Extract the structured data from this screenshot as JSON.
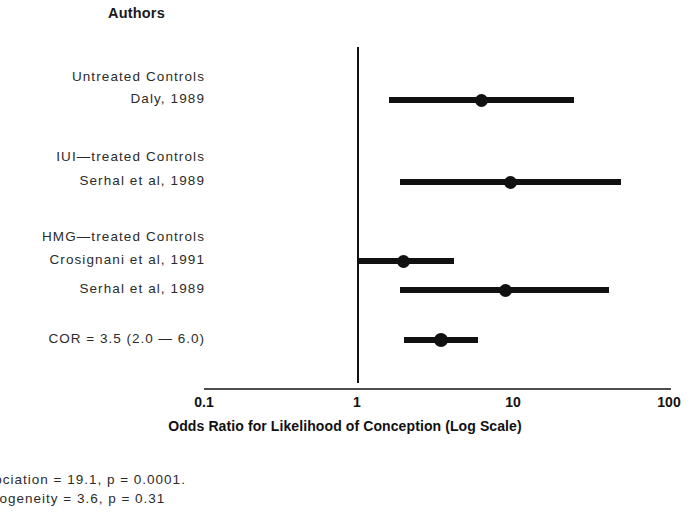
{
  "figure": {
    "heading": "Authors",
    "axis_title": "Odds Ratio for Likelihood of Conception (Log Scale)"
  },
  "rows": [
    {
      "label": "Untreated Controls",
      "kind": "group"
    },
    {
      "label": "Daly, 1989",
      "kind": "study"
    },
    {
      "label": "IUI—treated Controls",
      "kind": "group"
    },
    {
      "label": "Serhal et al, 1989",
      "kind": "study"
    },
    {
      "label": "HMG—treated Controls",
      "kind": "group"
    },
    {
      "label": "Crosignani et al, 1991",
      "kind": "study"
    },
    {
      "label": "Serhal et al, 1989",
      "kind": "study"
    },
    {
      "label": "COR = 3.5 (2.0 — 6.0)",
      "kind": "summary"
    }
  ],
  "footnote": {
    "line1": "r association = 19.1, p = 0.0001.",
    "line2": "r homogeneity = 3.6, p = 0.31"
  },
  "chart_data": {
    "type": "forest",
    "title": "",
    "xlabel": "Odds Ratio for Likelihood of Conception (Log Scale)",
    "ylabel": "Authors",
    "scale": "log10",
    "xlim": [
      0.1,
      100
    ],
    "xticks": [
      "0.1",
      "1",
      "10",
      "100"
    ],
    "xtick_values": [
      0.1,
      1,
      10,
      100
    ],
    "reference_line": 1,
    "grid": false,
    "legend": null,
    "groups": [
      {
        "name": "Untreated Controls"
      },
      {
        "name": "IUI—treated Controls"
      },
      {
        "name": "HMG—treated Controls"
      }
    ],
    "points": [
      {
        "label": "Daly, 1989",
        "group": "Untreated Controls",
        "or": 6.3,
        "ci_low": 1.6,
        "ci_high": 25.0,
        "summary": false
      },
      {
        "label": "Serhal et al, 1989",
        "group": "IUI—treated Controls",
        "or": 9.8,
        "ci_low": 1.9,
        "ci_high": 50.0,
        "summary": false
      },
      {
        "label": "Crosignani et al, 1991",
        "group": "HMG—treated Controls",
        "or": 2.0,
        "ci_low": 1.0,
        "ci_high": 4.2,
        "summary": false
      },
      {
        "label": "Serhal et al, 1989",
        "group": "HMG—treated Controls",
        "or": 9.0,
        "ci_low": 1.9,
        "ci_high": 42.0,
        "summary": false
      },
      {
        "label": "COR = 3.5 (2.0 — 6.0)",
        "group": "Summary",
        "or": 3.5,
        "ci_low": 2.0,
        "ci_high": 6.0,
        "summary": true
      }
    ],
    "statistics": {
      "chi2_association": 19.1,
      "p_association": 0.0001,
      "chi2_homogeneity": 3.6,
      "p_homogeneity": 0.31
    }
  },
  "layout": {
    "row_y": [
      78,
      100,
      158,
      182,
      238,
      261,
      290,
      340
    ],
    "point_y": [
      100,
      182,
      261,
      290,
      340
    ],
    "ref_line": {
      "x": 357,
      "top": 47,
      "bottom": 383
    },
    "axis": {
      "y": 388,
      "x_left": 204,
      "x_right": 671
    },
    "tick_x": [
      204,
      357,
      513,
      669
    ],
    "px_per_decade": 155.3
  }
}
